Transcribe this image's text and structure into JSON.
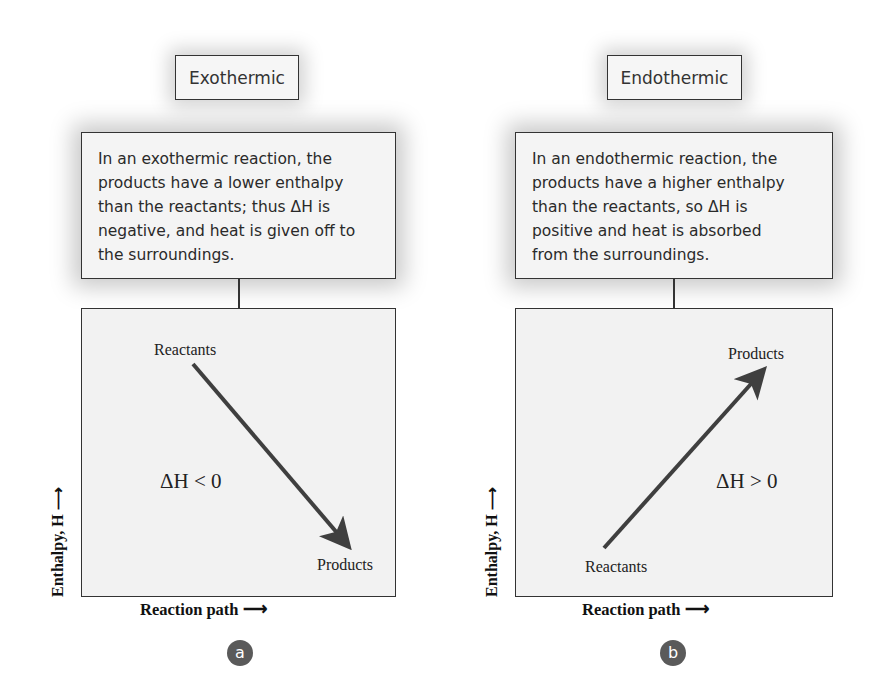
{
  "panels": {
    "a": {
      "title": "Exothermic",
      "description_lines": [
        "In an exothermic reaction, the",
        "products have a lower enthalpy",
        "than the reactants; thus ΔH is",
        "negative, and heat is given off to",
        "the surroundings."
      ],
      "start_label": "Reactants",
      "end_label": "Products",
      "delta_label": "ΔH < 0",
      "y_axis_label": "Enthalpy, H",
      "x_axis_label": "Reaction path",
      "marker": "a"
    },
    "b": {
      "title": "Endothermic",
      "description_lines": [
        "In an endothermic reaction, the",
        "products have a higher enthalpy",
        "than the reactants, so ΔH is",
        "positive and heat is absorbed",
        "from the surroundings."
      ],
      "start_label": "Reactants",
      "end_label": "Products",
      "delta_label": "ΔH > 0",
      "y_axis_label": "Enthalpy, H",
      "x_axis_label": "Reaction path",
      "marker": "b"
    }
  },
  "colors": {
    "arrow": "#3f3f3f",
    "border": "#333333",
    "box_fill": "#f2f2f2",
    "marker_fill": "#5a5a5a"
  }
}
